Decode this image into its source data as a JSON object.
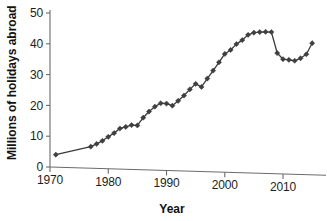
{
  "chart_data": {
    "type": "line",
    "title": "",
    "subtitle": "",
    "xlabel": "Year",
    "ylabel": "Millions of holidays abroad",
    "xlim": [
      1970,
      2016
    ],
    "ylim": [
      0,
      50
    ],
    "xticks": [
      1970,
      1980,
      1990,
      2000,
      2010
    ],
    "xtick_labels": [
      "1970",
      "1980",
      "1990",
      "2000",
      "2010"
    ],
    "yticks": [
      0,
      10,
      20,
      30,
      40,
      50
    ],
    "ytick_labels": [
      "0",
      "10",
      "20",
      "30",
      "40",
      "50"
    ],
    "grid": false,
    "legend": null,
    "marker": "diamond",
    "line_color": "#3a3a3a",
    "marker_color": "#3f3f3f",
    "axis_color": "#6b6b6b",
    "background": "#ffffff",
    "series": [
      {
        "name": "Holidays abroad",
        "x": [
          1971,
          1977,
          1978,
          1979,
          1980,
          1981,
          1982,
          1983,
          1984,
          1985,
          1986,
          1987,
          1988,
          1989,
          1990,
          1991,
          1992,
          1993,
          1994,
          1995,
          1996,
          1997,
          1998,
          1999,
          2000,
          2001,
          2002,
          2003,
          2004,
          2005,
          2006,
          2007,
          2008,
          2009,
          2010,
          2011,
          2012,
          2013,
          2014,
          2015
        ],
        "values": [
          4.0,
          6.6,
          7.5,
          8.5,
          9.8,
          11.0,
          12.5,
          13.0,
          13.6,
          13.5,
          16.0,
          18.0,
          19.6,
          20.7,
          20.6,
          19.9,
          21.5,
          23.2,
          25.2,
          27.0,
          26.0,
          28.7,
          31.3,
          34.0,
          36.7,
          38.0,
          39.9,
          41.2,
          42.9,
          43.6,
          43.8,
          43.9,
          43.8,
          37.0,
          35.0,
          34.8,
          34.5,
          35.3,
          36.6,
          40.2
        ]
      }
    ]
  }
}
